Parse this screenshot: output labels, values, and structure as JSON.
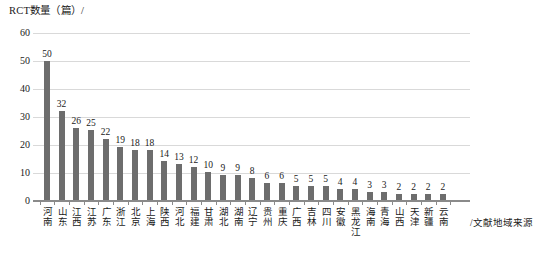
{
  "chart_data": {
    "type": "bar",
    "title": "",
    "ylabel": "RCT数量（篇）/",
    "xlabel": "/文献地域来源",
    "ylim": [
      0,
      60
    ],
    "yticks": [
      0,
      10,
      20,
      30,
      40,
      50,
      60
    ],
    "grid": true,
    "legend": null,
    "bar_color": "#6d6d6d",
    "categories": [
      "河南",
      "山东",
      "江西",
      "江苏",
      "广东",
      "浙江",
      "北京",
      "上海",
      "陕西",
      "河北",
      "福建",
      "甘肃",
      "湖北",
      "湖南",
      "辽宁",
      "贵州",
      "重庆",
      "广西",
      "吉林",
      "四川",
      "安徽",
      "黑龙江",
      "海南",
      "青海",
      "山西",
      "天津",
      "新疆",
      "云南"
    ],
    "values": [
      50,
      32,
      26,
      25,
      22,
      19,
      18,
      18,
      14,
      13,
      12,
      10,
      9,
      9,
      8,
      6,
      6,
      5,
      5,
      5,
      4,
      4,
      3,
      3,
      2,
      2,
      2,
      2
    ],
    "value_labels": [
      "50",
      "32",
      "26",
      "25",
      "22",
      "19",
      "18",
      "18",
      "14",
      "13",
      "12",
      "10",
      "9",
      "9",
      "8",
      "6",
      "6",
      "5",
      "5",
      "5",
      "4",
      "4",
      "3",
      "3",
      "2",
      "2",
      "2",
      "2"
    ]
  }
}
